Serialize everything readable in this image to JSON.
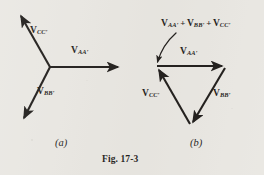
{
  "figure": {
    "caption": "Fig. 17-3",
    "background_color": "#e9e7e2",
    "ink_color": "#171412"
  },
  "panel_a": {
    "caption": "(a)",
    "description": "three-phase star phasor diagram with three phasors at 120 degrees",
    "vectors": [
      {
        "name": "V_CC'",
        "symbol": "V",
        "subscript": "CC′",
        "angle_deg": 120,
        "length": 65,
        "label_x": 30,
        "label_y": 28
      },
      {
        "name": "V_AA'",
        "symbol": "V",
        "subscript": "AA′",
        "angle_deg": 0,
        "length": 72,
        "label_x": 70,
        "label_y": 48
      },
      {
        "name": "V_BB'",
        "symbol": "V",
        "subscript": "BB′",
        "angle_deg": 240,
        "length": 64,
        "label_x": 36,
        "label_y": 88
      }
    ]
  },
  "panel_b": {
    "caption": "(b)",
    "description": "closed phasor triangle showing the sum of the three phasors is zero",
    "sum_label": {
      "terms": [
        "V",
        "V",
        "V"
      ],
      "subscripts": [
        "AA′",
        "BB′",
        "CC′"
      ],
      "operator": "+",
      "text": "V_AA' + V_BB' + V_CC'"
    },
    "vectors": [
      {
        "name": "V_AA'",
        "symbol": "V",
        "subscript": "AA′",
        "label_x": 181,
        "label_y": 48
      },
      {
        "name": "V_BB'",
        "symbol": "V",
        "subscript": "BB′",
        "label_x": 213,
        "label_y": 90
      },
      {
        "name": "V_CC'",
        "symbol": "V",
        "subscript": "CC′",
        "label_x": 144,
        "label_y": 90
      }
    ]
  }
}
